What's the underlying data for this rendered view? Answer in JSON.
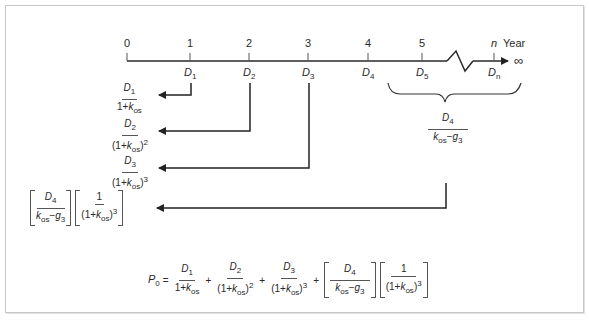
{
  "timeline": {
    "ticks": [
      "0",
      "1",
      "2",
      "3",
      "4",
      "5",
      "n"
    ],
    "axis_label": "Year",
    "infinity": "∞",
    "dividends": [
      {
        "base": "D",
        "sub": "1"
      },
      {
        "base": "D",
        "sub": "2"
      },
      {
        "base": "D",
        "sub": "3"
      },
      {
        "base": "D",
        "sub": "4"
      },
      {
        "base": "D",
        "sub": "5"
      },
      {
        "base": "D",
        "sub": "n"
      }
    ]
  },
  "terms": {
    "t1": {
      "num": "D",
      "num_sub": "1",
      "den_pre": "1+",
      "den_k": "k",
      "den_k_sub": "os",
      "den_post": "",
      "den_exp": ""
    },
    "t2": {
      "num": "D",
      "num_sub": "2",
      "den_pre": "(1+",
      "den_k": "k",
      "den_k_sub": "os",
      "den_post": ")",
      "den_exp": "2"
    },
    "t3": {
      "num": "D",
      "num_sub": "3",
      "den_pre": "(1+",
      "den_k": "k",
      "den_k_sub": "os",
      "den_post": ")",
      "den_exp": "3"
    },
    "terminal": {
      "num": "D",
      "num_sub": "4",
      "den_k": "k",
      "den_k_sub": "os",
      "minus": "−",
      "den_g": "g",
      "den_g_sub": "3"
    },
    "discount": {
      "num": "1",
      "den_pre": "(1+",
      "den_k": "k",
      "den_k_sub": "os",
      "den_post": ")",
      "den_exp": "3"
    }
  },
  "formula": {
    "lhs": "P",
    "lhs_sub": "0",
    "equals": "=",
    "plus": "+"
  }
}
